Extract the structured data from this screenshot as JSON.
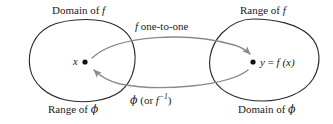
{
  "figure": {
    "colors": {
      "blob_stroke": "#2b2b2b",
      "arrow_stroke": "#8a8a8a",
      "point_fill": "#111111",
      "text": "#1a1a1a",
      "background": "#ffffff"
    },
    "labels": {
      "domain_f": "Domain of f",
      "domain_f_plain": "Domain of",
      "domain_f_var": "f",
      "range_f_plain": "Range of",
      "range_f_var": "f",
      "f_one_to_one_var": "f",
      "f_one_to_one_text": "one-to-one",
      "x_point": "x",
      "y_point_lhs": "y",
      "y_point_eq": "=",
      "y_point_fn": "f",
      "y_point_arg": "(x)",
      "range_phi_plain": "Range of",
      "range_phi_var": "ϕ",
      "domain_phi_plain": "Domain of",
      "domain_phi_var": "ϕ",
      "inverse_phi": "ϕ",
      "inverse_open": "(or",
      "inverse_f": "f",
      "inverse_sup": "−1",
      "inverse_close": ")"
    },
    "points": [
      {
        "name": "x",
        "cx": 85,
        "cy": 62
      },
      {
        "name": "y = f(x)",
        "cx": 253,
        "cy": 62
      }
    ],
    "sets": [
      {
        "name": "left-set",
        "top_label": "Domain of f",
        "bottom_label": "Range of ϕ"
      },
      {
        "name": "right-set",
        "top_label": "Range of f",
        "bottom_label": "Domain of ϕ"
      }
    ],
    "arrows": [
      {
        "name": "forward-map",
        "label": "f one-to-one",
        "from": "x",
        "to": "y = f(x)"
      },
      {
        "name": "inverse-map",
        "label": "ϕ (or f−1)",
        "from": "y = f(x)",
        "to": "x"
      }
    ]
  }
}
